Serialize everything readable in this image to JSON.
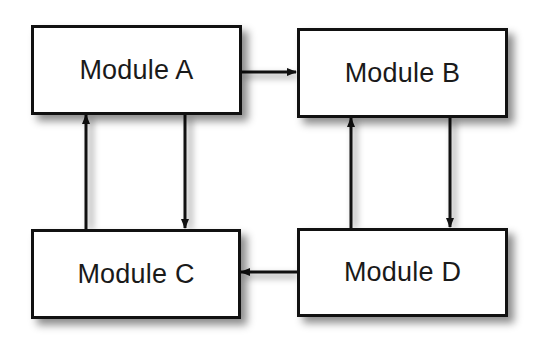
{
  "diagram": {
    "nodes": [
      {
        "id": "A",
        "label": "Module A"
      },
      {
        "id": "B",
        "label": "Module B"
      },
      {
        "id": "C",
        "label": "Module C"
      },
      {
        "id": "D",
        "label": "Module D"
      }
    ],
    "edges": [
      {
        "from": "A",
        "to": "B"
      },
      {
        "from": "A",
        "to": "C"
      },
      {
        "from": "C",
        "to": "A"
      },
      {
        "from": "B",
        "to": "D"
      },
      {
        "from": "D",
        "to": "B"
      },
      {
        "from": "D",
        "to": "C"
      }
    ],
    "colors": {
      "stroke": "#111111",
      "fill": "#ffffff",
      "text": "#1a1a1a"
    }
  }
}
